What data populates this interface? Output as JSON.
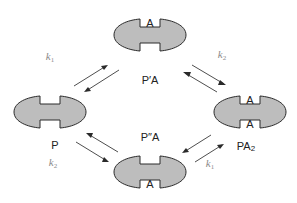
{
  "diagram": {
    "type": "reaction-cycle",
    "colors": {
      "molecule_fill": "#bdbdbd",
      "outline": "#2b2b2b",
      "rate_label": "#8a8a8a"
    },
    "states": [
      {
        "id": "top",
        "label": "P′A",
        "notch_top": "A",
        "notch_bottom": ""
      },
      {
        "id": "left",
        "label": "P",
        "notch_top": "",
        "notch_bottom": ""
      },
      {
        "id": "right",
        "label": "PA",
        "label_sub": "2",
        "notch_top": "A",
        "notch_bottom": "A"
      },
      {
        "id": "bottom",
        "label": "P″A",
        "notch_top": "",
        "notch_bottom": "A"
      }
    ],
    "transitions": [
      {
        "from": "P",
        "to": "P′A",
        "rate": "k",
        "rate_sub": "1"
      },
      {
        "from": "P′A",
        "to": "PA2",
        "rate": "k",
        "rate_sub": "2"
      },
      {
        "from": "P",
        "to": "P″A",
        "rate": "k",
        "rate_sub": "2"
      },
      {
        "from": "P″A",
        "to": "PA2",
        "rate": "k",
        "rate_sub": "1"
      }
    ]
  }
}
